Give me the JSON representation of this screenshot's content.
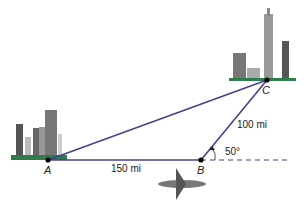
{
  "points": {
    "A": "A",
    "B": "B",
    "C": "C"
  },
  "sides": {
    "AB": "150 mi",
    "BC": "100 mi"
  },
  "angle": "50°",
  "colors": {
    "line": "#4a3f8f",
    "ground": "#2e7d4a",
    "building": "#8a8a8a"
  }
}
